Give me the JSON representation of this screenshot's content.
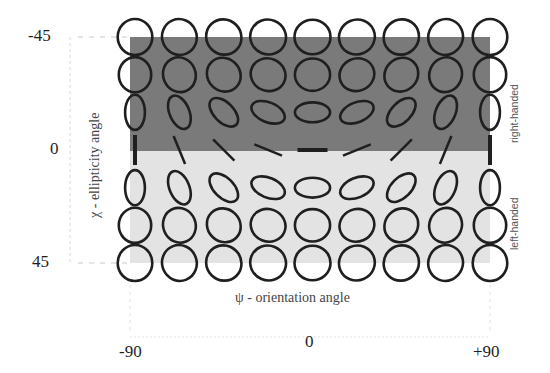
{
  "figure": {
    "x_axis": {
      "label": "ψ - orientation angle",
      "ticks": [
        "-90",
        "0",
        "+90"
      ]
    },
    "y_axis": {
      "label": "χ - ellipticity angle",
      "ticks": [
        "-45",
        "0",
        "45"
      ]
    },
    "regions": {
      "upper": {
        "label": "right-handed",
        "color": "#7a7a7a"
      },
      "lower": {
        "label": "left-handed",
        "color": "#e3e3e3"
      }
    },
    "grid": {
      "psi_values_deg": [
        -90,
        -67.5,
        -45,
        -22.5,
        0,
        22.5,
        45,
        67.5,
        90
      ],
      "chi_values_deg": [
        -45,
        -30,
        -15,
        0,
        15,
        30,
        45
      ],
      "stroke_color": "#1f1f1f"
    }
  }
}
